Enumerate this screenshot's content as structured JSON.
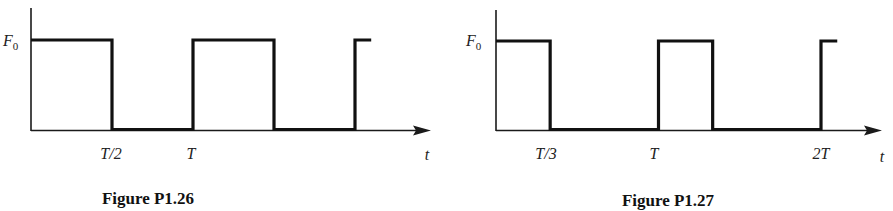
{
  "figures": [
    {
      "id": "p1_26",
      "caption": "Figure P1.26",
      "y_label": "F",
      "y_label_sub": "0",
      "x_axis_label": "t",
      "tick_labels": [
        "T/2",
        "T"
      ],
      "waveform": {
        "type": "square pulse train",
        "amplitude_label": "F0",
        "period_label": "T",
        "duty_cycle": 0.5,
        "segments": [
          {
            "from_T": 0,
            "to_T": 0.5,
            "level": "F0"
          },
          {
            "from_T": 0.5,
            "to_T": 1,
            "level": 0
          },
          {
            "from_T": 1,
            "to_T": 1.5,
            "level": "F0"
          },
          {
            "from_T": 1.5,
            "to_T": 2,
            "level": 0
          },
          {
            "from_T": 2,
            "to_T": 2.1,
            "level": "F0"
          }
        ]
      }
    },
    {
      "id": "p1_27",
      "caption": "Figure P1.27",
      "y_label": "F",
      "y_label_sub": "0",
      "x_axis_label": "t",
      "tick_labels": [
        "T/3",
        "T",
        "2T"
      ],
      "waveform": {
        "type": "rectangular pulse train",
        "amplitude_label": "F0",
        "period_label": "T",
        "duty_cycle": 0.3333,
        "segments": [
          {
            "from_T": 0,
            "to_T": 0.3333,
            "level": "F0"
          },
          {
            "from_T": 0.3333,
            "to_T": 1,
            "level": 0
          },
          {
            "from_T": 1,
            "to_T": 1.3333,
            "level": "F0"
          },
          {
            "from_T": 1.3333,
            "to_T": 2,
            "level": 0
          },
          {
            "from_T": 2,
            "to_T": 2.1,
            "level": "F0"
          }
        ]
      }
    }
  ]
}
